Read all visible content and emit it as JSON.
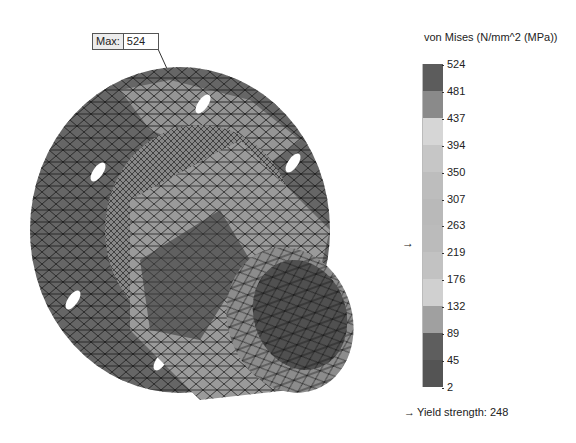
{
  "annotation": {
    "label": "Max:",
    "value": "524"
  },
  "legend": {
    "title": "von Mises (N/mm^2 (MPa))",
    "ticks": [
      "524",
      "481",
      "437",
      "394",
      "350",
      "307",
      "263",
      "219",
      "176",
      "132",
      "89",
      "45",
      "2"
    ],
    "segment_colors": [
      "#5c5c5c",
      "#8a8a8a",
      "#d6d6d6",
      "#c6c6c6",
      "#bdbdbd",
      "#b9b9b9",
      "#bbbbbb",
      "#c2c2c2",
      "#d0d0d0",
      "#a0a0a0",
      "#5e5e5e",
      "#545454"
    ],
    "yield_arrow": "→",
    "yield_label": "Yield strength: 248"
  },
  "chart_data": {
    "type": "heatmap",
    "title": "von Mises (N/mm^2 (MPa))",
    "min": 2,
    "max": 524,
    "colorbar_ticks": [
      524,
      481,
      437,
      394,
      350,
      307,
      263,
      219,
      176,
      132,
      89,
      45,
      2
    ],
    "annotations": [
      {
        "text": "Max: 524"
      },
      {
        "text": "Yield strength: 248"
      }
    ],
    "yield_strength": 248
  }
}
